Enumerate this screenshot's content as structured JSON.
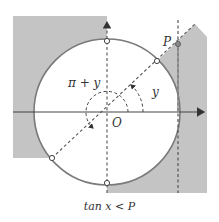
{
  "labels": {
    "angle_pi_plus_y": "π + y",
    "angle_y": "y",
    "origin": "O",
    "point_p": "P"
  },
  "caption": "tan x < P",
  "colors": {
    "shade": "#c4c4c4",
    "circle": "#7a7a7a",
    "axis": "#444444",
    "dash": "#555555"
  }
}
